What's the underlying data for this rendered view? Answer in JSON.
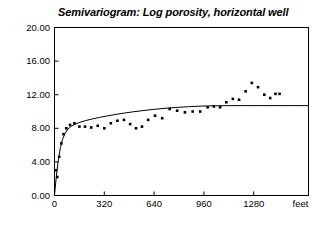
{
  "chart_data": {
    "type": "scatter",
    "title": "Semivariogram: Log porosity, horizontal well",
    "xlabel": "feet",
    "ylabel": "",
    "xlim": [
      0,
      1632
    ],
    "ylim": [
      0,
      20
    ],
    "grid": false,
    "legend": null,
    "xticks": [
      0,
      320,
      640,
      960,
      1280
    ],
    "xtick_labels": [
      "0",
      "320",
      "640",
      "960",
      "1280"
    ],
    "yticks": [
      0,
      4,
      8,
      12,
      16,
      20
    ],
    "ytick_labels": [
      "0.00",
      "4.00",
      "8.00",
      "12.00",
      "16.00",
      "20.00"
    ],
    "axis_unit_label": "feet",
    "series": [
      {
        "name": "experimental semivariogram",
        "type": "scatter",
        "marker": "square",
        "color": "#000000",
        "points": [
          [
            10,
            3.0
          ],
          [
            18,
            2.2
          ],
          [
            30,
            4.6
          ],
          [
            44,
            6.2
          ],
          [
            58,
            7.3
          ],
          [
            76,
            8.0
          ],
          [
            100,
            8.4
          ],
          [
            128,
            8.6
          ],
          [
            160,
            8.2
          ],
          [
            196,
            8.2
          ],
          [
            236,
            8.1
          ],
          [
            278,
            8.3
          ],
          [
            320,
            8.0
          ],
          [
            362,
            8.6
          ],
          [
            404,
            8.9
          ],
          [
            446,
            9.0
          ],
          [
            486,
            8.5
          ],
          [
            524,
            8.0
          ],
          [
            562,
            8.2
          ],
          [
            602,
            9.0
          ],
          [
            646,
            9.5
          ],
          [
            692,
            9.2
          ],
          [
            740,
            10.3
          ],
          [
            788,
            10.1
          ],
          [
            838,
            9.9
          ],
          [
            888,
            10.0
          ],
          [
            936,
            10.0
          ],
          [
            984,
            10.5
          ],
          [
            1024,
            10.6
          ],
          [
            1064,
            10.5
          ],
          [
            1104,
            11.1
          ],
          [
            1146,
            11.5
          ],
          [
            1186,
            11.4
          ],
          [
            1228,
            12.4
          ],
          [
            1268,
            13.4
          ],
          [
            1308,
            12.9
          ],
          [
            1348,
            12.0
          ],
          [
            1386,
            11.6
          ],
          [
            1420,
            12.1
          ],
          [
            1446,
            12.1
          ]
        ]
      },
      {
        "name": "fitted model",
        "type": "line",
        "color": "#000000",
        "sill": 10.7,
        "points": [
          [
            0,
            0.0
          ],
          [
            8,
            1.6
          ],
          [
            16,
            3.0
          ],
          [
            26,
            4.4
          ],
          [
            38,
            5.7
          ],
          [
            52,
            6.7
          ],
          [
            68,
            7.4
          ],
          [
            86,
            7.9
          ],
          [
            108,
            8.25
          ],
          [
            134,
            8.5
          ],
          [
            164,
            8.72
          ],
          [
            200,
            8.92
          ],
          [
            240,
            9.1
          ],
          [
            284,
            9.28
          ],
          [
            332,
            9.45
          ],
          [
            384,
            9.62
          ],
          [
            440,
            9.79
          ],
          [
            500,
            9.95
          ],
          [
            564,
            10.1
          ],
          [
            632,
            10.24
          ],
          [
            704,
            10.37
          ],
          [
            780,
            10.48
          ],
          [
            860,
            10.57
          ],
          [
            944,
            10.64
          ],
          [
            1032,
            10.68
          ],
          [
            1124,
            10.7
          ],
          [
            1220,
            10.7
          ],
          [
            1320,
            10.7
          ],
          [
            1424,
            10.7
          ],
          [
            1530,
            10.7
          ],
          [
            1632,
            10.7
          ]
        ]
      }
    ]
  }
}
